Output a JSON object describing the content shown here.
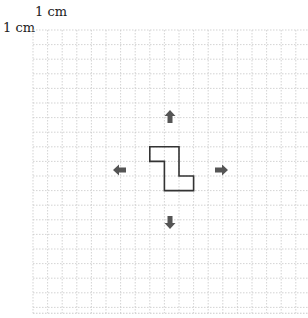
{
  "labels": {
    "horizontal_unit": "1 cm",
    "vertical_unit": "1 cm"
  },
  "grid": {
    "left": 33,
    "top": 30,
    "cell": 14.6,
    "columns": 19,
    "rows": 19.4,
    "line_color": "#c8c8c8",
    "border_color": "#bbbbbb"
  },
  "shape": {
    "name": "S-tetromino-like polygon",
    "origin_cell": [
      8,
      8
    ],
    "points_cells": [
      [
        0,
        0
      ],
      [
        2,
        0
      ],
      [
        2,
        2
      ],
      [
        3,
        2
      ],
      [
        3,
        3
      ],
      [
        1,
        3
      ],
      [
        1,
        1
      ],
      [
        0,
        1
      ]
    ],
    "stroke": "#333333"
  },
  "arrows": [
    {
      "direction": "up",
      "cx": 170,
      "cy": 116
    },
    {
      "direction": "left",
      "cx": 119,
      "cy": 170
    },
    {
      "direction": "right",
      "cx": 222,
      "cy": 170
    },
    {
      "direction": "down",
      "cx": 170,
      "cy": 223
    }
  ],
  "arrow_color": "#555555"
}
